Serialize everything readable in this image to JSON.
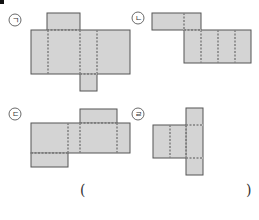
{
  "question_marker": "■",
  "answer": {
    "open_paren": "(",
    "close_paren": ")",
    "value": ""
  },
  "colors": {
    "fill": "#d4d4d4",
    "stroke": "#555555",
    "dash": "#555555"
  },
  "figures": [
    {
      "id": "giyeok",
      "label": "ㄱ",
      "label_pos": [
        15,
        20
      ],
      "solids": [
        [
          47,
          13,
          33,
          17
        ],
        [
          31,
          30,
          99,
          44
        ],
        [
          80,
          74,
          17,
          17
        ]
      ],
      "dashes": [
        [
          48,
          30,
          48,
          74
        ],
        [
          80,
          30,
          80,
          74
        ],
        [
          97,
          30,
          97,
          74
        ],
        [
          80,
          74,
          97,
          74
        ],
        [
          47,
          30,
          80,
          30
        ]
      ]
    },
    {
      "id": "nieun",
      "label": "ㄴ",
      "label_pos": [
        138,
        18
      ],
      "solids": [
        [
          152,
          13,
          49,
          17
        ],
        [
          184,
          30,
          67,
          33
        ]
      ],
      "dashes": [
        [
          184,
          13,
          184,
          30
        ],
        [
          201,
          30,
          201,
          63
        ],
        [
          218,
          30,
          218,
          63
        ],
        [
          235,
          30,
          235,
          63
        ],
        [
          184,
          30,
          201,
          30
        ]
      ]
    },
    {
      "id": "digeut",
      "label": "ㄷ",
      "label_pos": [
        15,
        114
      ],
      "solids": [
        [
          80,
          109,
          37,
          14
        ],
        [
          31,
          123,
          99,
          30
        ],
        [
          31,
          153,
          37,
          14
        ]
      ],
      "dashes": [
        [
          68,
          123,
          68,
          153
        ],
        [
          80,
          123,
          80,
          153
        ],
        [
          117,
          123,
          117,
          153
        ],
        [
          80,
          123,
          117,
          123
        ],
        [
          31,
          153,
          68,
          153
        ]
      ]
    },
    {
      "id": "rieul",
      "label": "ㄹ",
      "label_pos": [
        138,
        114
      ],
      "solids": [
        [
          186,
          108,
          17,
          67
        ],
        [
          153,
          125,
          33,
          33
        ]
      ],
      "dashes": [
        [
          170,
          125,
          170,
          158
        ],
        [
          186,
          125,
          186,
          158
        ],
        [
          186,
          125,
          203,
          125
        ],
        [
          186,
          158,
          203,
          158
        ]
      ]
    }
  ]
}
